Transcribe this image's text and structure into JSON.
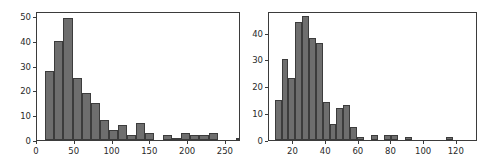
{
  "figure": {
    "background": "#ffffff",
    "bar_color": "#6e6e6e",
    "bar_edge_color": "#3c3c3c",
    "axis_color": "#3b3b3b",
    "text_color": "#2a2a2a"
  },
  "chart_data": [
    {
      "type": "bar",
      "subtype": "histogram",
      "panel": "left",
      "title": "",
      "xlabel": "",
      "ylabel": "",
      "xlim": [
        0,
        270
      ],
      "ylim": [
        0,
        52
      ],
      "grid": false,
      "legend": null,
      "xticks": [
        0,
        50,
        100,
        150,
        200,
        250
      ],
      "xticklabels": [
        "0",
        "50",
        "100",
        "150",
        "200",
        "250"
      ],
      "yticks": [
        0,
        10,
        20,
        30,
        40,
        50
      ],
      "yticklabels": [
        "0",
        "10",
        "20",
        "30",
        "40",
        "50"
      ],
      "bin_width": 12,
      "bin_edges": [
        11,
        23,
        35,
        47,
        59,
        71,
        83,
        95,
        107,
        119,
        131,
        143,
        155,
        167,
        179,
        191,
        203,
        215,
        227,
        239,
        251,
        263
      ],
      "categories": [
        "11-23",
        "23-35",
        "35-47",
        "47-59",
        "59-71",
        "71-83",
        "83-95",
        "95-107",
        "107-119",
        "119-131",
        "131-143",
        "143-155",
        "155-167",
        "167-179",
        "179-191",
        "191-203",
        "203-215",
        "215-227",
        "227-239",
        "239-251",
        "251-263"
      ],
      "values": [
        28,
        40,
        49,
        25,
        19,
        15,
        8,
        4,
        6,
        2,
        7,
        3,
        0,
        2,
        1,
        3,
        2,
        2,
        3,
        0,
        0,
        1
      ]
    },
    {
      "type": "bar",
      "subtype": "histogram",
      "panel": "right",
      "title": "",
      "xlabel": "",
      "ylabel": "",
      "xlim": [
        5,
        133
      ],
      "ylim": [
        0,
        48
      ],
      "grid": false,
      "legend": null,
      "xticks": [
        20,
        40,
        60,
        80,
        100,
        120
      ],
      "xticklabels": [
        "20",
        "40",
        "60",
        "80",
        "100",
        "120"
      ],
      "yticks": [
        0,
        10,
        20,
        30,
        40
      ],
      "yticklabels": [
        "0",
        "10",
        "20",
        "30",
        "40"
      ],
      "bin_width": 4.2,
      "bin_edges": [
        8.5,
        12.7,
        16.9,
        21.1,
        25.3,
        29.5,
        33.7,
        37.9,
        42.1,
        46.3,
        50.5,
        54.7,
        58.9,
        63.1,
        67.3,
        71.5,
        75.7,
        79.9,
        84.1,
        88.3,
        92.5,
        96.7,
        100.9,
        105.1,
        109.3,
        113.5,
        117.7,
        121.9,
        126.1
      ],
      "categories": [
        "8.5-12.7",
        "12.7-16.9",
        "16.9-21.1",
        "21.1-25.3",
        "25.3-29.5",
        "29.5-33.7",
        "33.7-37.9",
        "37.9-42.1",
        "42.1-46.3",
        "46.3-50.5",
        "50.5-54.7",
        "54.7-58.9",
        "58.9-63.1",
        "63.1-67.3",
        "67.3-71.5",
        "71.5-75.7",
        "75.7-79.9",
        "79.9-84.1",
        "84.1-88.3",
        "88.3-92.5",
        "92.5-96.7",
        "96.7-100.9",
        "100.9-105.1",
        "105.1-109.3",
        "109.3-113.5",
        "113.5-117.7",
        "117.7-121.9",
        "121.9-126.1"
      ],
      "values": [
        15,
        30,
        23,
        44,
        46,
        38,
        36,
        14,
        6,
        12,
        13,
        5,
        1,
        0,
        2,
        0,
        2,
        2,
        0,
        1,
        0,
        0,
        0,
        0,
        0,
        1
      ]
    }
  ]
}
